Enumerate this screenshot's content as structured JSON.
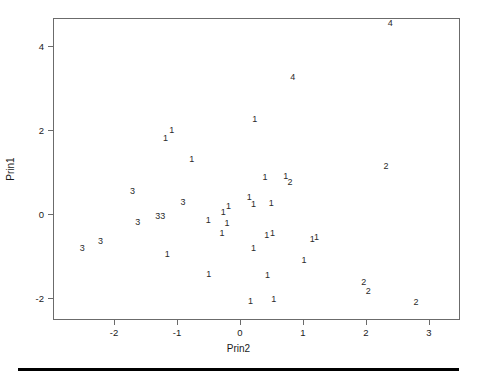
{
  "chart_data": {
    "type": "scatter",
    "title": "",
    "xlabel": "Prin2",
    "ylabel": "Prin1",
    "xlim": [
      -2.85,
      3.6
    ],
    "ylim": [
      -2.3,
      4.75
    ],
    "grid": false,
    "legend": null,
    "marker_style": "group-number-as-text-label",
    "xticks": [
      -2,
      -1,
      0,
      1,
      2,
      3
    ],
    "xticklabels": [
      "-2",
      "-1",
      "0",
      "1",
      "2",
      "3"
    ],
    "yticks": [
      4,
      2,
      0,
      -2
    ],
    "yticklabels": [
      "4",
      "2",
      "0",
      "-2"
    ],
    "groups": [
      "1",
      "2",
      "3",
      "4"
    ],
    "points": [
      {
        "label": "4",
        "x": 2.37,
        "y": 4.58
      },
      {
        "label": "4",
        "x": 0.82,
        "y": 3.28
      },
      {
        "label": "1",
        "x": 0.22,
        "y": 2.28
      },
      {
        "label": "1",
        "x": -1.1,
        "y": 2.02
      },
      {
        "label": "1",
        "x": -1.2,
        "y": 1.83
      },
      {
        "label": "1",
        "x": -0.78,
        "y": 1.33
      },
      {
        "label": "2",
        "x": 2.3,
        "y": 1.17
      },
      {
        "label": "1",
        "x": 0.38,
        "y": 0.9
      },
      {
        "label": "1",
        "x": 0.71,
        "y": 0.93
      },
      {
        "label": "2",
        "x": 0.78,
        "y": 0.78
      },
      {
        "label": "3",
        "x": -1.72,
        "y": 0.56
      },
      {
        "label": "1",
        "x": 0.13,
        "y": 0.42
      },
      {
        "label": "3",
        "x": -0.92,
        "y": 0.3
      },
      {
        "label": "1",
        "x": 0.2,
        "y": 0.27
      },
      {
        "label": "1",
        "x": 0.48,
        "y": 0.28
      },
      {
        "label": "1",
        "x": -0.2,
        "y": 0.22
      },
      {
        "label": "1",
        "x": -0.28,
        "y": 0.07
      },
      {
        "label": "3",
        "x": -1.32,
        "y": -0.03
      },
      {
        "label": "3",
        "x": -1.24,
        "y": -0.03
      },
      {
        "label": "3",
        "x": -1.64,
        "y": -0.16
      },
      {
        "label": "1",
        "x": -0.52,
        "y": -0.13
      },
      {
        "label": "1",
        "x": -0.22,
        "y": -0.19
      },
      {
        "label": "1",
        "x": -0.3,
        "y": -0.43
      },
      {
        "label": "1",
        "x": 0.41,
        "y": -0.48
      },
      {
        "label": "1",
        "x": 0.5,
        "y": -0.42
      },
      {
        "label": "1",
        "x": 1.13,
        "y": -0.58
      },
      {
        "label": "1",
        "x": 1.2,
        "y": -0.52
      },
      {
        "label": "3",
        "x": -2.23,
        "y": -0.61
      },
      {
        "label": "3",
        "x": -2.52,
        "y": -0.79
      },
      {
        "label": "1",
        "x": 0.2,
        "y": -0.79
      },
      {
        "label": "1",
        "x": -1.17,
        "y": -0.92
      },
      {
        "label": "1",
        "x": 1.0,
        "y": -1.06
      },
      {
        "label": "1",
        "x": -0.51,
        "y": -1.4
      },
      {
        "label": "1",
        "x": 0.42,
        "y": -1.43
      },
      {
        "label": "2",
        "x": 1.95,
        "y": -1.59
      },
      {
        "label": "2",
        "x": 2.02,
        "y": -1.8
      },
      {
        "label": "1",
        "x": 0.15,
        "y": -2.04
      },
      {
        "label": "1",
        "x": 0.52,
        "y": -2.0
      },
      {
        "label": "2",
        "x": 2.78,
        "y": -2.06
      }
    ]
  },
  "figure": {
    "xaxis_title": "Prin2",
    "yaxis_title": "Prin1",
    "footer_rule": true
  }
}
